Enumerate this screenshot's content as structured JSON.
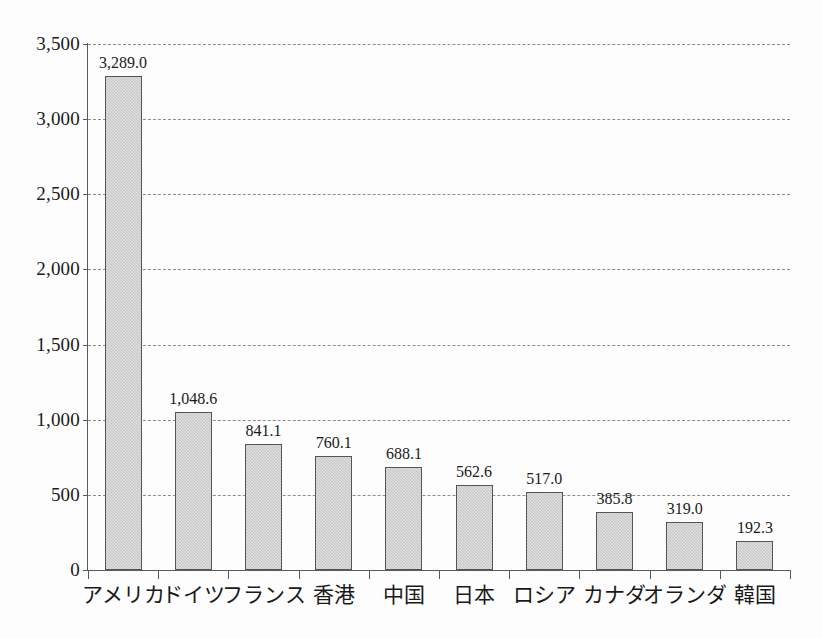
{
  "chart_data": {
    "type": "bar",
    "title": "",
    "subtitle": "",
    "xlabel": "",
    "ylabel": "",
    "categories": [
      "アメリカ",
      "ドイツ",
      "フランス",
      "香港",
      "中国",
      "日本",
      "ロシア",
      "カナダ",
      "オランダ",
      "韓国"
    ],
    "values": [
      3289.0,
      1048.6,
      841.1,
      760.1,
      688.1,
      562.6,
      517.0,
      385.8,
      319.0,
      192.3
    ],
    "value_labels": [
      "3,289.0",
      "1,048.6",
      "841.1",
      "760.1",
      "688.1",
      "562.6",
      "517.0",
      "385.8",
      "319.0",
      "192.3"
    ],
    "ylim": [
      0,
      3500
    ],
    "ytick_values": [
      0,
      500,
      1000,
      1500,
      2000,
      2500,
      3000,
      3500
    ],
    "ytick_labels": [
      "0",
      "500",
      "1,000",
      "1,500",
      "2,000",
      "2,500",
      "3,000",
      "3,500"
    ],
    "grid": "horizontal-dashed",
    "legend": "none",
    "bar_fill_color": "#e4e4e4",
    "bar_border_color": "#555555",
    "gridline_color": "#8c8c8c",
    "axis_color": "#5a5a5a",
    "background_color": "#fdfdfd"
  }
}
